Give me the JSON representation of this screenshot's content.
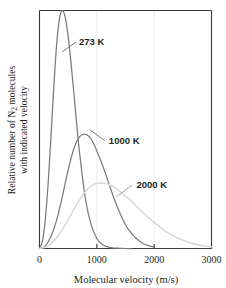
{
  "chart_data": {
    "type": "line",
    "title": "",
    "xlabel": "Molecular velocity (m/s)",
    "ylabel_line1": "Relative number of N",
    "ylabel_sub": "2",
    "ylabel_line1_tail": " molecules",
    "ylabel_line2": "with indicated velocity",
    "ylabel_full": "Relative number of N2 molecules with indicated velocity",
    "xlim": [
      0,
      3000
    ],
    "ylim": [
      0,
      1.0
    ],
    "xticks": [
      0,
      1000,
      2000,
      3000
    ],
    "xtick_labels": [
      "0",
      "1000",
      "2000",
      "3000"
    ],
    "yticks": [],
    "ytick_labels": [],
    "grid": "faint vertical gridlines at 1000 and 2000",
    "legend_position": "inline-annotations",
    "series": [
      {
        "name": "273 K",
        "label": "273 K",
        "color": "#7b7b7b",
        "peak_x": 400,
        "peak_y": 1.0,
        "x": [
          0,
          50,
          100,
          150,
          200,
          250,
          300,
          350,
          400,
          450,
          500,
          550,
          600,
          650,
          700,
          800,
          900,
          1000,
          1100,
          1200,
          1300,
          1400,
          1500,
          1600
        ],
        "y": [
          0.0,
          0.03,
          0.12,
          0.27,
          0.47,
          0.68,
          0.86,
          0.97,
          1.0,
          0.97,
          0.89,
          0.78,
          0.65,
          0.52,
          0.4,
          0.21,
          0.1,
          0.042,
          0.016,
          0.006,
          0.002,
          0.001,
          0.0,
          0.0
        ]
      },
      {
        "name": "1000 K",
        "label": "1000 K",
        "color": "#7b7b7b",
        "peak_x": 780,
        "peak_y": 0.48,
        "x": [
          0,
          100,
          200,
          300,
          400,
          500,
          600,
          700,
          800,
          900,
          1000,
          1100,
          1200,
          1300,
          1400,
          1500,
          1600,
          1700,
          1800,
          1900,
          2000
        ],
        "y": [
          0.0,
          0.01,
          0.05,
          0.12,
          0.22,
          0.33,
          0.42,
          0.47,
          0.48,
          0.46,
          0.41,
          0.35,
          0.28,
          0.21,
          0.15,
          0.1,
          0.065,
          0.04,
          0.022,
          0.012,
          0.006
        ]
      },
      {
        "name": "2000 K",
        "label": "2000 K",
        "color": "#d8d8d8",
        "peak_x": 1120,
        "peak_y": 0.275,
        "x": [
          0,
          100,
          200,
          300,
          400,
          500,
          600,
          700,
          800,
          900,
          1000,
          1100,
          1200,
          1300,
          1400,
          1500,
          1600,
          1700,
          1800,
          1900,
          2000,
          2200,
          2400,
          2600,
          2800,
          3000
        ],
        "y": [
          0.0,
          0.005,
          0.02,
          0.045,
          0.08,
          0.12,
          0.165,
          0.205,
          0.24,
          0.263,
          0.273,
          0.275,
          0.27,
          0.258,
          0.24,
          0.22,
          0.2,
          0.175,
          0.152,
          0.13,
          0.11,
          0.072,
          0.045,
          0.026,
          0.014,
          0.007
        ]
      }
    ],
    "annotations": [
      {
        "text": "273 K",
        "x": 690,
        "y": 0.855
      },
      {
        "text": "1000 K",
        "x": 1210,
        "y": 0.44
      },
      {
        "text": "2000 K",
        "x": 1690,
        "y": 0.255
      }
    ]
  },
  "colors": {
    "axis": "#3a3a3a",
    "frame": "#3a3a3a",
    "text": "#231f20",
    "grid": "#f0f0f0",
    "curve_dark": "#7b7b7b",
    "curve_light": "#d8d8d8",
    "leader": "#6e6e6e",
    "background": "#ffffff"
  }
}
